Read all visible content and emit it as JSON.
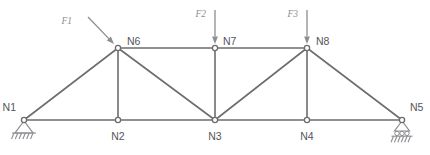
{
  "figure": {
    "type": "truss-diagram",
    "width": 430,
    "height": 155,
    "background_color": "#ffffff",
    "member_color": "#6d6d6d",
    "node_label_color": "#55555a",
    "force_color": "#8d8d92",
    "support_color": "#8d8d92"
  },
  "nodes": [
    {
      "id": "N1",
      "label": "N1",
      "x": 24,
      "y": 120,
      "label_x": 16,
      "label_y": 111,
      "label_anchor": "end"
    },
    {
      "id": "N2",
      "label": "N2",
      "x": 118,
      "y": 120,
      "label_x": 118,
      "label_y": 140,
      "label_anchor": "middle"
    },
    {
      "id": "N3",
      "label": "N3",
      "x": 215,
      "y": 120,
      "label_x": 215,
      "label_y": 140,
      "label_anchor": "middle"
    },
    {
      "id": "N4",
      "label": "N4",
      "x": 307,
      "y": 120,
      "label_x": 307,
      "label_y": 140,
      "label_anchor": "middle"
    },
    {
      "id": "N5",
      "label": "N5",
      "x": 402,
      "y": 120,
      "label_x": 410,
      "label_y": 111,
      "label_anchor": "start"
    },
    {
      "id": "N6",
      "label": "N6",
      "x": 118,
      "y": 48,
      "label_x": 127,
      "label_y": 45,
      "label_anchor": "start"
    },
    {
      "id": "N7",
      "label": "N7",
      "x": 215,
      "y": 48,
      "label_x": 223,
      "label_y": 45,
      "label_anchor": "start"
    },
    {
      "id": "N8",
      "label": "N8",
      "x": 307,
      "y": 48,
      "label_x": 316,
      "label_y": 45,
      "label_anchor": "start"
    }
  ],
  "members": [
    {
      "name": "bottom-chord-n1-n2",
      "from": "N1",
      "to": "N2"
    },
    {
      "name": "bottom-chord-n2-n3",
      "from": "N2",
      "to": "N3"
    },
    {
      "name": "bottom-chord-n3-n4",
      "from": "N3",
      "to": "N4"
    },
    {
      "name": "bottom-chord-n4-n5",
      "from": "N4",
      "to": "N5"
    },
    {
      "name": "top-chord-n6-n7",
      "from": "N6",
      "to": "N7"
    },
    {
      "name": "top-chord-n7-n8",
      "from": "N7",
      "to": "N8"
    },
    {
      "name": "diagonal-n1-n6",
      "from": "N1",
      "to": "N6"
    },
    {
      "name": "diagonal-n6-n3",
      "from": "N6",
      "to": "N3"
    },
    {
      "name": "diagonal-n3-n8",
      "from": "N3",
      "to": "N8"
    },
    {
      "name": "diagonal-n8-n5",
      "from": "N8",
      "to": "N5"
    },
    {
      "name": "vertical-n2-n6",
      "from": "N2",
      "to": "N6"
    },
    {
      "name": "vertical-n3-n7",
      "from": "N3",
      "to": "N7"
    },
    {
      "name": "vertical-n4-n8",
      "from": "N4",
      "to": "N8"
    }
  ],
  "forces": [
    {
      "id": "F1",
      "label": "F1",
      "applied_to": "N6",
      "direction": "diagonal-down-right",
      "tail_x": 88,
      "tail_y": 17,
      "tip_x": 114,
      "tip_y": 44,
      "label_x": 72,
      "label_y": 24
    },
    {
      "id": "F2",
      "label": "F2",
      "applied_to": "N7",
      "direction": "down",
      "tail_x": 215,
      "tail_y": 10,
      "tip_x": 215,
      "tip_y": 44,
      "label_x": 206,
      "label_y": 17
    },
    {
      "id": "F3",
      "label": "F3",
      "applied_to": "N8",
      "direction": "down",
      "tail_x": 307,
      "tail_y": 10,
      "tip_x": 307,
      "tip_y": 44,
      "label_x": 298,
      "label_y": 17
    }
  ],
  "supports": [
    {
      "id": "support-n1",
      "type": "pinned",
      "at_node": "N1",
      "x": 24,
      "y": 120
    },
    {
      "id": "support-n5",
      "type": "roller",
      "at_node": "N5",
      "x": 402,
      "y": 120
    }
  ]
}
